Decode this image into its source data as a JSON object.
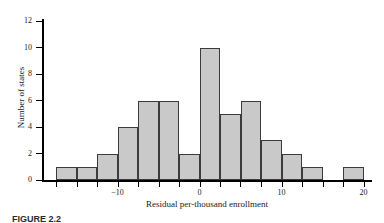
{
  "figure": {
    "caption": "FIGURE 2.2"
  },
  "chart_data": {
    "type": "bar",
    "title": "",
    "subtitle": "",
    "xlabel": "Residual per-thousand enrollment",
    "ylabel": "Number of states",
    "grid": false,
    "legend": false,
    "legend_position": "none",
    "bin_width": 2.5,
    "xlim": [
      -20,
      22.5
    ],
    "ylim": [
      0,
      12
    ],
    "x_tick_labels": [
      "-10",
      "0",
      "10",
      "20"
    ],
    "x_tick_values": [
      -10,
      0,
      10,
      20
    ],
    "y_tick_labels": [
      "0",
      "2",
      "4",
      "6",
      "8",
      "10",
      "12"
    ],
    "y_tick_values": [
      0,
      2,
      4,
      6,
      8,
      10,
      12
    ],
    "bins": [
      {
        "start": -17.5,
        "end": -15.0,
        "value": 1
      },
      {
        "start": -15.0,
        "end": -12.5,
        "value": 1
      },
      {
        "start": -12.5,
        "end": -10.0,
        "value": 2
      },
      {
        "start": -10.0,
        "end": -7.5,
        "value": 4
      },
      {
        "start": -7.5,
        "end": -5.0,
        "value": 6
      },
      {
        "start": -5.0,
        "end": -2.5,
        "value": 6
      },
      {
        "start": -2.5,
        "end": 0.0,
        "value": 2
      },
      {
        "start": 0.0,
        "end": 2.5,
        "value": 10
      },
      {
        "start": 2.5,
        "end": 5.0,
        "value": 5
      },
      {
        "start": 5.0,
        "end": 7.5,
        "value": 6
      },
      {
        "start": 7.5,
        "end": 10.0,
        "value": 3
      },
      {
        "start": 10.0,
        "end": 12.5,
        "value": 2
      },
      {
        "start": 12.5,
        "end": 15.0,
        "value": 1
      },
      {
        "start": 15.0,
        "end": 17.5,
        "value": 0
      },
      {
        "start": 17.5,
        "end": 20.0,
        "value": 1
      }
    ],
    "categories": [
      "-17.5",
      "-15",
      "-12.5",
      "-10",
      "-7.5",
      "-5",
      "-2.5",
      "0",
      "2.5",
      "5",
      "7.5",
      "10",
      "12.5",
      "15",
      "17.5"
    ],
    "values": [
      1,
      1,
      2,
      4,
      6,
      6,
      2,
      10,
      5,
      6,
      3,
      2,
      1,
      0,
      1
    ],
    "colors": {
      "bar_fill": "#c9c9c9",
      "bar_stroke": "#3b3b3b",
      "axis": "#000000",
      "text": "#1a1a1a",
      "background": "#ffffff"
    }
  }
}
